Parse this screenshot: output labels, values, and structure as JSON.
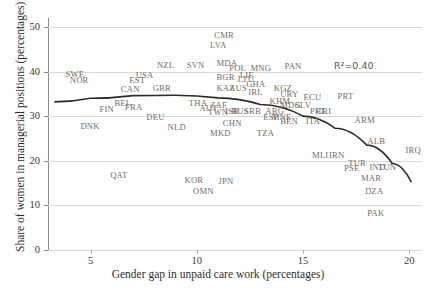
{
  "chart_data": {
    "type": "scatter",
    "title": "",
    "xlabel": "Gender gap in unpaid care work  (percentages)",
    "ylabel": "Share of women in managerial positions  (percentages)",
    "xlim": [
      3.0,
      20.6
    ],
    "ylim": [
      0,
      52
    ],
    "xticks": [
      5,
      10,
      15,
      20
    ],
    "yticks": [
      0,
      10,
      20,
      30,
      40,
      50
    ],
    "grid": "horizontal",
    "legend": "none",
    "annotations": [
      {
        "text": "R²=0.40",
        "x": 17.4,
        "y": 41.4
      }
    ],
    "trendline": {
      "type": "quadratic",
      "description": "fitted curve peaking near x=9 then declining",
      "points": [
        {
          "x": 3.3,
          "y": 33.2
        },
        {
          "x": 5.0,
          "y": 34.0
        },
        {
          "x": 7.0,
          "y": 34.6
        },
        {
          "x": 9.0,
          "y": 34.7
        },
        {
          "x": 11.0,
          "y": 34.1
        },
        {
          "x": 13.0,
          "y": 32.6
        },
        {
          "x": 15.0,
          "y": 30.0
        },
        {
          "x": 16.5,
          "y": 27.3
        },
        {
          "x": 18.0,
          "y": 23.5
        },
        {
          "x": 19.2,
          "y": 19.4
        },
        {
          "x": 20.1,
          "y": 15.2
        }
      ]
    },
    "points": [
      {
        "label": "CMR",
        "x": 11.25,
        "y": 48.1
      },
      {
        "label": "LVA",
        "x": 11.05,
        "y": 46.0
      },
      {
        "label": "NZL",
        "x": 8.55,
        "y": 41.4
      },
      {
        "label": "SVN",
        "x": 9.95,
        "y": 41.4
      },
      {
        "label": "MDA",
        "x": 11.35,
        "y": 41.9
      },
      {
        "label": "POL",
        "x": 11.95,
        "y": 40.9
      },
      {
        "label": "MNG",
        "x": 12.95,
        "y": 40.9
      },
      {
        "label": "PAN",
        "x": 14.55,
        "y": 41.3
      },
      {
        "label": "SWE",
        "x": 4.25,
        "y": 39.5
      },
      {
        "label": "NOR",
        "x": 4.45,
        "y": 38.0
      },
      {
        "label": "USA",
        "x": 7.55,
        "y": 39.3
      },
      {
        "label": "EST",
        "x": 7.25,
        "y": 38.1
      },
      {
        "label": "BGR",
        "x": 11.35,
        "y": 38.8
      },
      {
        "label": "LIE",
        "x": 12.45,
        "y": 39.3
      },
      {
        "label": "LTU",
        "x": 12.35,
        "y": 38.4
      },
      {
        "label": "CAN",
        "x": 6.85,
        "y": 36.1
      },
      {
        "label": "GBR",
        "x": 8.35,
        "y": 36.3
      },
      {
        "label": "KAZ",
        "x": 11.35,
        "y": 36.2
      },
      {
        "label": "AUS",
        "x": 11.95,
        "y": 36.2
      },
      {
        "label": "GHA",
        "x": 12.75,
        "y": 37.2
      },
      {
        "label": "IRL",
        "x": 12.85,
        "y": 35.5
      },
      {
        "label": "KGZ",
        "x": 14.05,
        "y": 36.3
      },
      {
        "label": "URY",
        "x": 14.35,
        "y": 35.0
      },
      {
        "label": "ECU",
        "x": 15.45,
        "y": 34.2
      },
      {
        "label": "PRT",
        "x": 17.05,
        "y": 34.6
      },
      {
        "label": "BEL",
        "x": 6.55,
        "y": 32.9
      },
      {
        "label": "FRA",
        "x": 7.05,
        "y": 32.0
      },
      {
        "label": "FIN",
        "x": 5.85,
        "y": 31.7
      },
      {
        "label": "THA",
        "x": 10.05,
        "y": 33.0
      },
      {
        "label": "ZAF",
        "x": 11.05,
        "y": 32.6
      },
      {
        "label": "AUT",
        "x": 10.55,
        "y": 31.8
      },
      {
        "label": "KHM",
        "x": 13.85,
        "y": 33.4
      },
      {
        "label": "MDG",
        "x": 14.35,
        "y": 32.4
      },
      {
        "label": "SLV",
        "x": 15.05,
        "y": 32.4
      },
      {
        "label": "DEU",
        "x": 8.05,
        "y": 29.9
      },
      {
        "label": "TWN",
        "x": 10.95,
        "y": 31.0
      },
      {
        "label": "ISR",
        "x": 11.75,
        "y": 31.1
      },
      {
        "label": "RUS",
        "x": 12.05,
        "y": 31.1
      },
      {
        "label": "SRB",
        "x": 12.65,
        "y": 31.2
      },
      {
        "label": "ARG",
        "x": 13.65,
        "y": 31.1
      },
      {
        "label": "PHL",
        "x": 15.75,
        "y": 31.1
      },
      {
        "label": "CRI",
        "x": 16.05,
        "y": 31.2
      },
      {
        "label": "ESP",
        "x": 13.55,
        "y": 29.9
      },
      {
        "label": "MNE",
        "x": 13.95,
        "y": 29.7
      },
      {
        "label": "BEN",
        "x": 14.35,
        "y": 28.9
      },
      {
        "label": "ITA",
        "x": 15.55,
        "y": 28.9
      },
      {
        "label": "ARM",
        "x": 17.85,
        "y": 29.2
      },
      {
        "label": "DNK",
        "x": 4.95,
        "y": 27.9
      },
      {
        "label": "NLD",
        "x": 9.05,
        "y": 27.6
      },
      {
        "label": "CHN",
        "x": 11.65,
        "y": 28.4
      },
      {
        "label": "MKD",
        "x": 11.05,
        "y": 26.2
      },
      {
        "label": "TZA",
        "x": 13.25,
        "y": 26.2
      },
      {
        "label": "ALB",
        "x": 18.45,
        "y": 24.4
      },
      {
        "label": "IRQ",
        "x": 20.25,
        "y": 22.5
      },
      {
        "label": "MLI",
        "x": 15.85,
        "y": 21.2
      },
      {
        "label": "IRN",
        "x": 16.65,
        "y": 21.2
      },
      {
        "label": "TUR",
        "x": 17.55,
        "y": 19.5
      },
      {
        "label": "PSE",
        "x": 17.35,
        "y": 18.3
      },
      {
        "label": "IND",
        "x": 18.55,
        "y": 18.5
      },
      {
        "label": "TUN",
        "x": 18.95,
        "y": 18.5
      },
      {
        "label": "QAT",
        "x": 6.35,
        "y": 16.9
      },
      {
        "label": "KOR",
        "x": 9.85,
        "y": 15.6
      },
      {
        "label": "JPN",
        "x": 11.45,
        "y": 15.4
      },
      {
        "label": "MAR",
        "x": 18.15,
        "y": 16.1
      },
      {
        "label": "OMN",
        "x": 10.25,
        "y": 13.2
      },
      {
        "label": "DZA",
        "x": 18.35,
        "y": 13.3
      },
      {
        "label": "PAK",
        "x": 18.45,
        "y": 8.2
      }
    ]
  }
}
